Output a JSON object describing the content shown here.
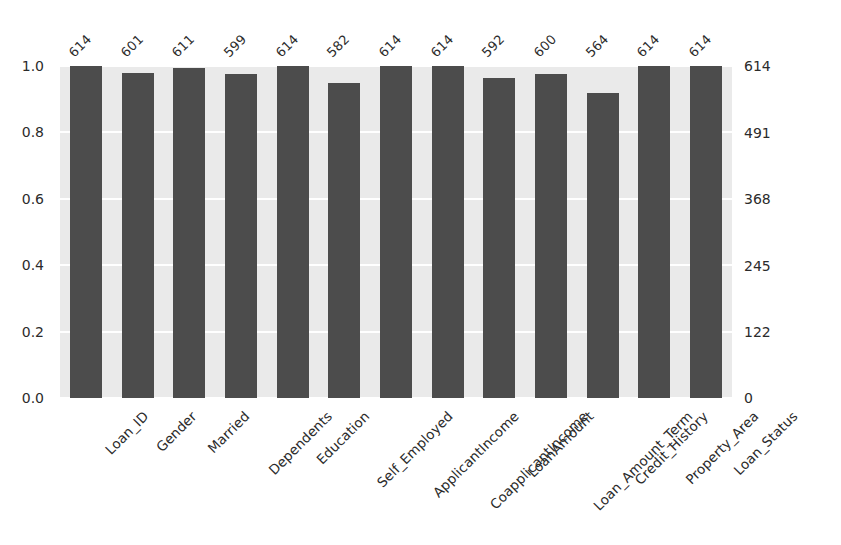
{
  "chart_data": {
    "type": "bar",
    "title": "",
    "subtitle": "",
    "xlabel": "",
    "ylabel": "",
    "categories": [
      "Loan_ID",
      "Gender",
      "Married",
      "Dependents",
      "Education",
      "Self_Employed",
      "ApplicantIncome",
      "CoapplicantIncome",
      "LoanAmount",
      "Loan_Amount_Term",
      "Credit_History",
      "Property_Area",
      "Loan_Status"
    ],
    "values": [
      614,
      601,
      611,
      599,
      614,
      582,
      614,
      614,
      592,
      600,
      564,
      614,
      614
    ],
    "bar_labels": [
      "614",
      "601",
      "611",
      "599",
      "614",
      "582",
      "614",
      "614",
      "592",
      "600",
      "564",
      "614",
      "614"
    ],
    "normalized_values": [
      1.0,
      0.9788,
      0.9951,
      0.9756,
      1.0,
      0.9479,
      1.0,
      1.0,
      0.9642,
      0.9772,
      0.9186,
      1.0,
      1.0
    ],
    "left_axis": {
      "ticks": [
        "0.0",
        "0.2",
        "0.4",
        "0.6",
        "0.8",
        "1.0"
      ],
      "tick_values": [
        0.0,
        0.2,
        0.4,
        0.6,
        0.8,
        1.0
      ],
      "ylim": [
        0.0,
        1.0
      ],
      "label": ""
    },
    "right_axis": {
      "ticks": [
        "0",
        "122",
        "245",
        "368",
        "491",
        "614"
      ],
      "tick_values": [
        0,
        122,
        245,
        368,
        491,
        614
      ],
      "ylim": [
        0,
        614
      ],
      "label": ""
    },
    "grid": true,
    "grid_color": "#ffffff",
    "legend": null,
    "legend_position": "none",
    "bar_color": "#4c4c4c",
    "plot_background": "#eaeaea",
    "figure_background": "#ffffff",
    "x_tick_rotation": -45,
    "value_label_rotation": -45
  }
}
